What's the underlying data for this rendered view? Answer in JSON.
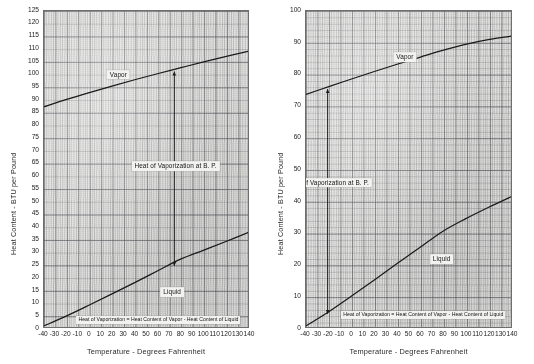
{
  "figure": {
    "title": "",
    "panel_count": 2
  },
  "chart_data": [
    {
      "type": "line",
      "panel": "left",
      "title": "",
      "xlabel": "Temperature - Degrees Fahrenheit",
      "ylabel": "Heat Content - BTU per Pound",
      "xlim": [
        -40,
        140
      ],
      "ylim": [
        0,
        125
      ],
      "xticks": [
        -40,
        -30,
        -20,
        -10,
        0,
        10,
        20,
        30,
        40,
        50,
        60,
        70,
        80,
        90,
        100,
        110,
        120,
        130,
        140
      ],
      "xtick_labels": [
        "-40",
        "-30",
        "-20",
        "-10",
        "0",
        "10",
        "20",
        "30",
        "40",
        "50",
        "60",
        "70",
        "80",
        "90",
        "100",
        "110",
        "120",
        "130",
        "140"
      ],
      "yticks": [
        0,
        5,
        10,
        15,
        20,
        25,
        30,
        35,
        40,
        45,
        50,
        55,
        60,
        65,
        70,
        75,
        80,
        85,
        90,
        95,
        100,
        105,
        110,
        115,
        120,
        125
      ],
      "ytick_labels": [
        "0",
        "5",
        "10",
        "15",
        "20",
        "25",
        "30",
        "35",
        "40",
        "45",
        "50",
        "55",
        "60",
        "65",
        "70",
        "75",
        "80",
        "85",
        "90",
        "95",
        "100",
        "105",
        "110",
        "115",
        "120",
        "125"
      ],
      "grid": true,
      "grid_style": "graph-paper",
      "legend": "inline-labels",
      "series": [
        {
          "name": "Vapor",
          "label_text": "Vapor",
          "label_x": 25,
          "label_y": 100,
          "x": [
            -40,
            -20,
            0,
            20,
            40,
            60,
            80,
            100,
            120,
            140
          ],
          "y": [
            87.0,
            89.9,
            92.6,
            95.2,
            97.7,
            100.1,
            102.4,
            104.7,
            106.9,
            109.0
          ]
        },
        {
          "name": "Liquid",
          "label_text": "Liquid",
          "label_x": 72,
          "label_y": 14.5,
          "x": [
            -40,
            -20,
            0,
            20,
            40,
            60,
            80,
            100,
            120,
            140
          ],
          "y": [
            0.0,
            4.0,
            8.3,
            12.7,
            17.2,
            21.8,
            26.4,
            29.9,
            33.4,
            37.0
          ]
        }
      ],
      "annotations": [
        {
          "name": "heat-of-vaporization-at-bp",
          "text": "Heat of Vaporization at B. P.",
          "kind": "vertical-measure",
          "x": 75,
          "y_low": 23.8,
          "y_high": 101.0,
          "label_x": 75,
          "label_y": 64
        },
        {
          "name": "definition-note",
          "text": "Heat of Vaporization = Heat Content of Vapor - Heat Content of Liquid",
          "kind": "note-box",
          "x": 60,
          "y": 3.5
        }
      ]
    },
    {
      "type": "line",
      "panel": "right",
      "title": "",
      "xlabel": "Temperature - Degrees Fahrenheit",
      "ylabel": "Heat Content - BTU per Pound",
      "xlim": [
        -40,
        140
      ],
      "ylim": [
        0,
        100
      ],
      "xticks": [
        -40,
        -30,
        -20,
        -10,
        0,
        10,
        20,
        30,
        40,
        50,
        60,
        70,
        80,
        90,
        100,
        110,
        120,
        130,
        140
      ],
      "xtick_labels": [
        "-40",
        "-30",
        "-20",
        "-10",
        "0",
        "10",
        "20",
        "30",
        "40",
        "50",
        "60",
        "70",
        "80",
        "90",
        "100",
        "110",
        "120",
        "130",
        "140"
      ],
      "yticks": [
        0,
        10,
        20,
        30,
        40,
        50,
        60,
        70,
        80,
        90,
        100
      ],
      "ytick_labels": [
        "0",
        "10",
        "20",
        "30",
        "40",
        "50",
        "60",
        "70",
        "80",
        "90",
        "100"
      ],
      "grid": true,
      "grid_style": "graph-paper",
      "legend": "inline-labels",
      "series": [
        {
          "name": "Vapor",
          "label_text": "Vapor",
          "label_x": 46,
          "label_y": 85.5,
          "x": [
            -40,
            -20,
            0,
            20,
            40,
            60,
            80,
            100,
            120,
            140
          ],
          "y": [
            73.5,
            76.0,
            78.4,
            80.8,
            83.1,
            85.3,
            87.5,
            89.4,
            90.9,
            92.0
          ]
        },
        {
          "name": "Liquid",
          "label_text": "Liquid",
          "label_x": 78,
          "label_y": 22.0,
          "x": [
            -40,
            -20,
            0,
            20,
            40,
            60,
            80,
            100,
            120,
            140
          ],
          "y": [
            0.0,
            4.5,
            9.5,
            14.6,
            19.8,
            24.9,
            30.0,
            34.0,
            37.6,
            41.0
          ]
        }
      ],
      "annotations": [
        {
          "name": "heat-of-vaporization-at-bp",
          "text": "Heat of Vaporization at B. P.",
          "kind": "vertical-measure",
          "x": -21,
          "y_low": 3.8,
          "y_high": 75.2,
          "label_x": -21,
          "label_y": 46
        },
        {
          "name": "definition-note",
          "text": "Heat of Vaporization = Heat Content of Vapor - Heat Content of Liquid",
          "kind": "note-box",
          "x": 62,
          "y": 4.5
        }
      ]
    }
  ],
  "colors": {
    "paper": "#e3e3e1",
    "grid_major": "#50505a",
    "grid_minor": "#6e6e74",
    "curve": "#1a1a1a",
    "axis": "#6e6e6e",
    "text": "#1c1c1c",
    "callout_bg": "#f2f2f0"
  }
}
